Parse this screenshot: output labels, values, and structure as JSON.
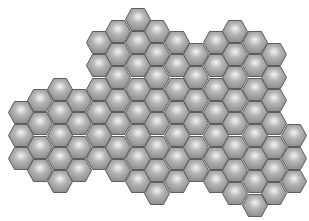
{
  "figure": {
    "colors": {
      "background": "#ffffff",
      "highlight": "#f4f4f4",
      "mid": "#b4b4b4",
      "edge_fill": "#8c8c8c",
      "stroke": "#5e5e5e"
    },
    "grid": {
      "orientation": "flat-top",
      "hex_width": 26,
      "hex_height": 23,
      "col_spacing": 19.5,
      "row_spacing": 23.2,
      "origin_x": 20.5,
      "even_origin_y": 19.5,
      "odd_origin_y": 31
    },
    "columns": [
      {
        "col": 0,
        "from": 4,
        "to": 6
      },
      {
        "col": 1,
        "from": 3,
        "to": 6
      },
      {
        "col": 2,
        "from": 3,
        "to": 7
      },
      {
        "col": 3,
        "from": 3,
        "to": 6
      },
      {
        "col": 4,
        "from": 1,
        "to": 6
      },
      {
        "col": 5,
        "from": 0,
        "to": 6
      },
      {
        "col": 6,
        "from": 0,
        "to": 7
      },
      {
        "col": 7,
        "from": 0,
        "to": 7
      },
      {
        "col": 8,
        "from": 1,
        "to": 7
      },
      {
        "col": 9,
        "from": 1,
        "to": 6
      },
      {
        "col": 10,
        "from": 1,
        "to": 7
      },
      {
        "col": 11,
        "from": 0,
        "to": 7
      },
      {
        "col": 12,
        "from": 1,
        "to": 8
      },
      {
        "col": 13,
        "from": 1,
        "to": 7
      },
      {
        "col": 14,
        "from": 5,
        "to": 7
      }
    ]
  }
}
